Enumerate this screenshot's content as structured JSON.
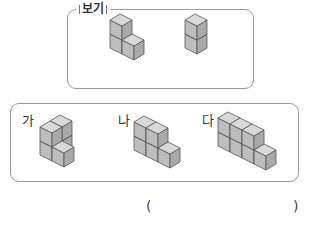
{
  "bogi": {
    "title": "보기",
    "shapes": [
      {
        "name": "L-shape of 3 cubes",
        "cubes": 3
      },
      {
        "name": "vertical stack of 2 cubes",
        "cubes": 2
      }
    ]
  },
  "options": [
    {
      "label": "가",
      "cubes": 5
    },
    {
      "label": "나",
      "cubes": 5
    },
    {
      "label": "다",
      "cubes": 7
    }
  ],
  "answer": {
    "open_paren": "(",
    "close_paren": ")",
    "value": ""
  },
  "colors": {
    "top_face": "#d9d9d9",
    "left_face": "#bdbdbd",
    "right_face": "#a9a9a9",
    "edge": "#555555",
    "border": "#9a9a9a"
  }
}
